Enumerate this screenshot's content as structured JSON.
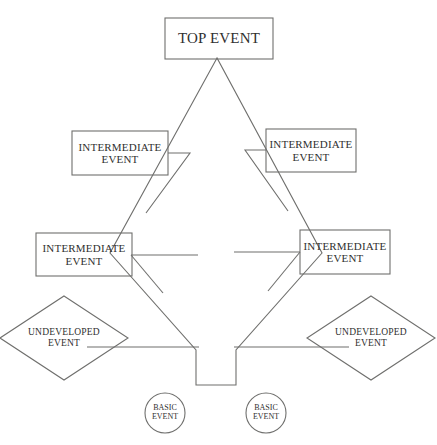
{
  "diagram": {
    "type": "fault-tree",
    "stroke_color": "#6f6f6d",
    "text_color": "#30302f",
    "background": "#ffffff",
    "nodes": [
      {
        "id": "top-event",
        "shape": "rectangle",
        "label_line1": "TOP EVENT",
        "label_line2": "",
        "x": 165,
        "y": 18,
        "w": 108,
        "h": 41
      },
      {
        "id": "intermediate-event-upper-left",
        "shape": "rectangle",
        "label_line1": "INTERMEDIATE",
        "label_line2": "EVENT",
        "x": 72,
        "y": 131,
        "w": 96,
        "h": 44
      },
      {
        "id": "intermediate-event-upper-right",
        "shape": "rectangle",
        "label_line1": "INTERMEDIATE",
        "label_line2": "EVENT",
        "x": 266,
        "y": 129,
        "w": 90,
        "h": 43
      },
      {
        "id": "intermediate-event-lower-left",
        "shape": "rectangle",
        "label_line1": "INTERMEDIATE",
        "label_line2": "EVENT",
        "x": 36,
        "y": 233,
        "w": 96,
        "h": 43
      },
      {
        "id": "intermediate-event-lower-right",
        "shape": "rectangle",
        "label_line1": "INTERMEDIATE",
        "label_line2": "EVENT",
        "x": 300,
        "y": 230,
        "w": 90,
        "h": 44
      },
      {
        "id": "undeveloped-event-left",
        "shape": "diamond",
        "label_line1": "UNDEVELOPED",
        "label_line2": "EVENT",
        "cx": 64,
        "cy": 338,
        "rx": 64,
        "ry": 42
      },
      {
        "id": "undeveloped-event-right",
        "shape": "diamond",
        "label_line1": "UNDEVELOPED",
        "label_line2": "EVENT",
        "cx": 371,
        "cy": 338,
        "rx": 64,
        "ry": 42
      },
      {
        "id": "basic-event-left",
        "shape": "circle",
        "label_line1": "BASIC",
        "label_line2": "EVENT",
        "cx": 165,
        "cy": 413,
        "r": 20
      },
      {
        "id": "basic-event-right",
        "shape": "circle",
        "label_line1": "BASIC",
        "label_line2": "EVENT",
        "cx": 266,
        "cy": 413,
        "r": 20
      }
    ],
    "connectors": {
      "main_outline": "M 217,58 L 110,253 L 196,350 L 196,385 L 236,385 L 236,350 L 322,253 L 217,58 Z",
      "gate_left_upper": "M 168,153 L 185,153 L 185,158",
      "gate_left_lower": "M 132,255 L 196,255",
      "gate_right_upper": "M 266,150 L 249,150",
      "gate_right_lower": "M 300,252 L 238,252",
      "branch_left_upper": "M 168,153 L 140,190",
      "branch_left_lower": "M 85,345 L 196,345",
      "branch_right_lower": "M 352,345 L 236,345",
      "segments": [
        {
          "name": "top-apex-left",
          "x1": 217,
          "y1": 58,
          "x2": 110,
          "y2": 253
        },
        {
          "name": "top-apex-right",
          "x1": 217,
          "y1": 58,
          "x2": 322,
          "y2": 253
        },
        {
          "name": "trunk-left-diagonal",
          "x1": 110,
          "y1": 253,
          "x2": 196,
          "y2": 350
        },
        {
          "name": "trunk-right-diagonal",
          "x1": 322,
          "y1": 253,
          "x2": 236,
          "y2": 350
        },
        {
          "name": "trunk-left-vertical",
          "x1": 196,
          "y1": 350,
          "x2": 196,
          "y2": 385
        },
        {
          "name": "trunk-bottom",
          "x1": 196,
          "y1": 385,
          "x2": 236,
          "y2": 385
        },
        {
          "name": "trunk-right-vertical",
          "x1": 236,
          "y1": 350,
          "x2": 236,
          "y2": 385
        }
      ]
    }
  }
}
